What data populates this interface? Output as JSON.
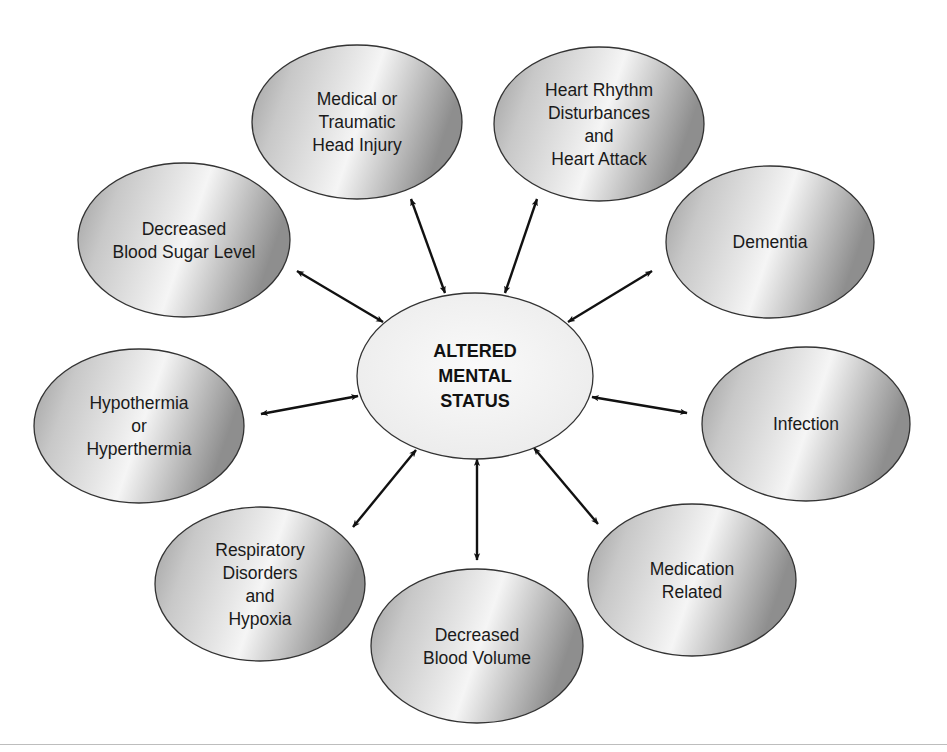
{
  "diagram": {
    "type": "hub-and-spoke",
    "colors": {
      "outer_fill_dark": "#9a9a9a",
      "outer_fill_light": "#f2f2f2",
      "center_fill": "#f4f4f4",
      "stroke": "#333333",
      "arrow": "#111111",
      "rule": "#bdbdbd"
    },
    "center": {
      "id": "altered-mental-status",
      "lines": [
        "ALTERED",
        "MENTAL",
        "STATUS"
      ],
      "cx": 475,
      "cy": 376,
      "rx": 118,
      "ry": 83
    },
    "nodes": [
      {
        "id": "head-injury",
        "lines": [
          "Medical or",
          "Traumatic",
          "Head Injury"
        ],
        "cx": 357,
        "cy": 122,
        "rx": 105,
        "ry": 77,
        "arrow": {
          "x1": 411,
          "y1": 199,
          "x2": 445,
          "y2": 293
        }
      },
      {
        "id": "heart",
        "lines": [
          "Heart Rhythm",
          "Disturbances",
          "and",
          "Heart Attack"
        ],
        "cx": 599,
        "cy": 124,
        "rx": 105,
        "ry": 77,
        "arrow": {
          "x1": 537,
          "y1": 199,
          "x2": 505,
          "y2": 293
        }
      },
      {
        "id": "dementia",
        "lines": [
          "Dementia"
        ],
        "cx": 770,
        "cy": 242,
        "rx": 104,
        "ry": 76,
        "arrow": {
          "x1": 652,
          "y1": 271,
          "x2": 568,
          "y2": 322
        }
      },
      {
        "id": "infection",
        "lines": [
          "Infection"
        ],
        "cx": 806,
        "cy": 424,
        "rx": 104,
        "ry": 77,
        "arrow": {
          "x1": 687,
          "y1": 413,
          "x2": 592,
          "y2": 397
        }
      },
      {
        "id": "medication",
        "lines": [
          "Medication",
          "Related"
        ],
        "cx": 692,
        "cy": 580,
        "rx": 104,
        "ry": 76,
        "arrow": {
          "x1": 598,
          "y1": 524,
          "x2": 534,
          "y2": 448
        }
      },
      {
        "id": "blood-volume",
        "lines": [
          "Decreased",
          "Blood Volume"
        ],
        "cx": 477,
        "cy": 646,
        "rx": 106,
        "ry": 77,
        "arrow": {
          "x1": 477,
          "y1": 560,
          "x2": 477,
          "y2": 459
        }
      },
      {
        "id": "respiratory",
        "lines": [
          "Respiratory",
          "Disorders",
          "and",
          "Hypoxia"
        ],
        "cx": 260,
        "cy": 584,
        "rx": 105,
        "ry": 77,
        "arrow": {
          "x1": 353,
          "y1": 527,
          "x2": 416,
          "y2": 450
        }
      },
      {
        "id": "temperature",
        "lines": [
          "Hypothermia",
          "or",
          "Hyperthermia"
        ],
        "cx": 139,
        "cy": 426,
        "rx": 105,
        "ry": 77,
        "arrow": {
          "x1": 261,
          "y1": 414,
          "x2": 358,
          "y2": 396
        }
      },
      {
        "id": "blood-sugar",
        "lines": [
          "Decreased",
          "Blood Sugar Level"
        ],
        "cx": 184,
        "cy": 240,
        "rx": 106,
        "ry": 77,
        "arrow": {
          "x1": 297,
          "y1": 271,
          "x2": 383,
          "y2": 322
        }
      }
    ]
  }
}
